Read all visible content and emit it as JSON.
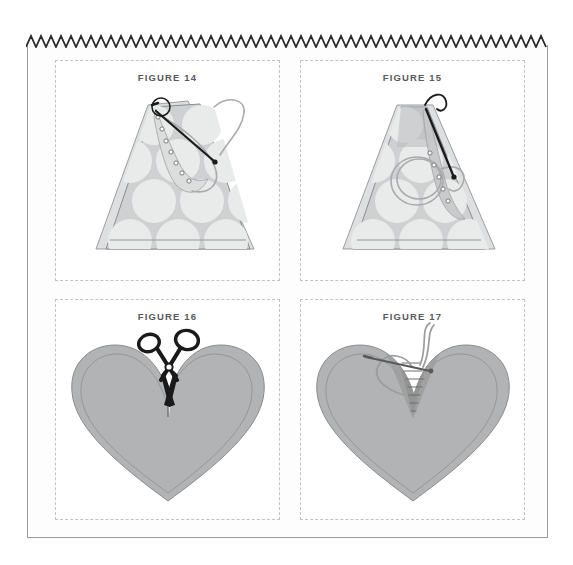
{
  "document": {
    "title": "Sewing Instruction Figures",
    "background_color": "#ffffff",
    "sheet_color": "#fdfdfd",
    "sheet_border_color": "#9a9a9a",
    "top_edge": {
      "name": "pinked-zigzag-edge",
      "color": "#2b2b2b",
      "teeth": 52,
      "tooth_width": 10,
      "tooth_height": 11
    }
  },
  "panels": [
    {
      "id": "figure-14",
      "caption": "FIGURE 14",
      "art_name": "triangle-fabric-with-needle-and-thread",
      "description": "Polka-dot triangular fabric piece with running stitch along the left slope and a threaded needle at the apex",
      "fabric_fill": "#cfd0d1",
      "dot_fill": "#e9eaea",
      "outline_color": "#8b8c8e",
      "needle_color": "#1a1a1a",
      "thread_color": "#a9aaac"
    },
    {
      "id": "figure-15",
      "caption": "FIGURE 15",
      "art_name": "triangle-fabric-gathered-with-needle",
      "description": "Same polka-dot triangular fabric, gathered on the right side with the needle pulling the thread taut",
      "fabric_fill": "#cfd0d1",
      "dot_fill": "#e9eaea",
      "outline_color": "#8b8c8e",
      "needle_color": "#1a1a1a",
      "thread_color": "#a9aaac"
    },
    {
      "id": "figure-16",
      "caption": "FIGURE 16",
      "art_name": "heart-shape-with-scissors",
      "description": "Solid gray heart shape with scissors snipping the notch at the top center",
      "heart_fill": "#b2b3b4",
      "heart_edge_fill": "#a9aaab",
      "outline_color": "#8b8c8e",
      "scissors_color": "#1a1a1a"
    },
    {
      "id": "figure-17",
      "caption": "FIGURE 17",
      "art_name": "heart-shape-with-needle-stitching",
      "description": "Gray heart shape with a threaded needle stitching across the top notch",
      "heart_fill": "#b2b3b4",
      "heart_edge_fill": "#a9aaab",
      "outline_color": "#8b8c8e",
      "needle_color": "#58595b",
      "thread_color": "#a9aaac"
    }
  ]
}
